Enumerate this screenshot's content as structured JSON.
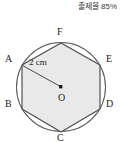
{
  "header": {
    "rate_label": "출제율 85%"
  },
  "figure": {
    "name": "regular-hexagon-inscribed-in-circle",
    "center_label": "O",
    "radius_label": "2 cm",
    "vertices": [
      {
        "id": "A",
        "label": "A",
        "x": 22,
        "y": 51,
        "label_x": 5,
        "label_y": 45
      },
      {
        "id": "B",
        "label": "B",
        "x": 22,
        "y": 95,
        "label_x": 5,
        "label_y": 90
      },
      {
        "id": "C",
        "label": "C",
        "x": 61,
        "y": 118,
        "label_x": 57,
        "label_y": 124
      },
      {
        "id": "D",
        "label": "D",
        "x": 100,
        "y": 95,
        "label_x": 105,
        "label_y": 90
      },
      {
        "id": "E",
        "label": "E",
        "x": 100,
        "y": 51,
        "label_x": 105,
        "label_y": 45
      },
      {
        "id": "F",
        "label": "F",
        "x": 61,
        "y": 29,
        "label_x": 57,
        "label_y": 16
      }
    ],
    "circle": {
      "cx": 61,
      "cy": 73,
      "r": 44
    },
    "colors": {
      "fill": "#e9e9e9",
      "stroke": "#4a4a4a",
      "circle_stroke": "#5a5a5a",
      "text": "#1c1c1c",
      "header_text": "#3a3a3a"
    }
  }
}
